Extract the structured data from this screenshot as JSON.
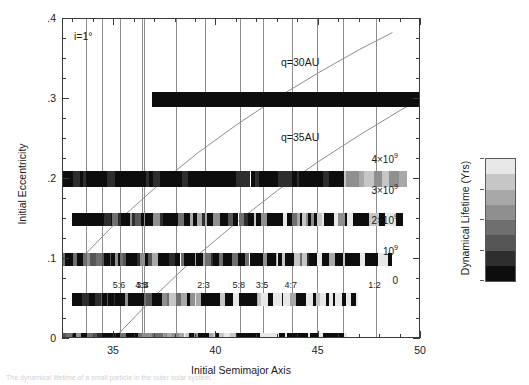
{
  "chart_data": {
    "type": "heatmap",
    "title": "",
    "xlabel": "Initial Semimajor Axis",
    "ylabel": "Initial Eccentricity",
    "xlim": [
      32.5,
      50
    ],
    "ylim": [
      0,
      0.4
    ],
    "xticks": [
      35,
      40,
      45,
      50
    ],
    "xticklabels": [
      "35",
      "40",
      "45",
      "50"
    ],
    "yticks": [
      0,
      0.1,
      0.2,
      0.3,
      0.4
    ],
    "yticklabels": [
      "0",
      ".1",
      ".2",
      ".3",
      ".4"
    ],
    "grid": false,
    "annotations": [
      {
        "name": "inclination",
        "text": "i=1°",
        "x": 33.2,
        "y": 0.378
      },
      {
        "name": "q30",
        "text": "q=30AU",
        "x": 43.2,
        "y": 0.352
      },
      {
        "name": "q35",
        "text": "q=35AU",
        "x": 43.2,
        "y": 0.258
      }
    ],
    "curves": [
      {
        "name": "q=30AU",
        "label": "q=30AU",
        "q": 30,
        "points": [
          [
            33.4,
            0.101
          ],
          [
            35.0,
            0.143
          ],
          [
            37.0,
            0.189
          ],
          [
            39.0,
            0.231
          ],
          [
            41.0,
            0.268
          ],
          [
            43.0,
            0.302
          ],
          [
            45.0,
            0.333
          ],
          [
            47.0,
            0.362
          ],
          [
            48.6,
            0.383
          ]
        ]
      },
      {
        "name": "q=35AU",
        "label": "q=35AU",
        "q": 35,
        "points": [
          [
            35.2,
            0.006
          ],
          [
            37.0,
            0.054
          ],
          [
            39.0,
            0.103
          ],
          [
            41.0,
            0.146
          ],
          [
            43.0,
            0.186
          ],
          [
            45.0,
            0.222
          ],
          [
            47.0,
            0.255
          ],
          [
            49.0,
            0.286
          ],
          [
            50.0,
            0.3
          ]
        ]
      }
    ],
    "resonances": [
      {
        "label": "5:6",
        "a": 35.28
      },
      {
        "label": "4:5",
        "a": 36.38
      },
      {
        "label": "3:4",
        "a": 36.44
      },
      {
        "label": "2:3",
        "a": 39.42
      },
      {
        "label": "5:8",
        "a": 41.14
      },
      {
        "label": "3:5",
        "a": 42.28
      },
      {
        "label": "4:7",
        "a": 43.68
      },
      {
        "label": "1:2",
        "a": 47.78
      }
    ],
    "extra_gridlines": [
      33.6,
      34.4,
      38.0,
      44.9,
      46.2
    ],
    "eccentricity_rows": [
      0.0,
      0.05,
      0.1,
      0.15,
      0.2,
      0.3
    ],
    "colorbar": {
      "title": "Dynamical Lifetime (Yrs)",
      "ticks": [
        0,
        1,
        2,
        3,
        4
      ],
      "ticklabels": [
        "0",
        "10⁹",
        "2×10⁹",
        "3×10⁹",
        "4×10⁹"
      ],
      "vmin": 0,
      "vmax": 4,
      "colors": [
        "#0d0d0d",
        "#2e2e2e",
        "#565656",
        "#6f6f6f",
        "#8f8f8f",
        "#a8a8a8",
        "#c6c6c6",
        "#e8e8e8"
      ]
    }
  },
  "caption": {
    "text": "The dynamical lifetime of a small particle in the outer solar system."
  }
}
